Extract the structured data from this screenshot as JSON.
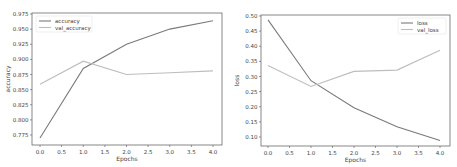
{
  "chart_data": [
    {
      "type": "line",
      "title": "",
      "xlabel": "Epochs",
      "ylabel": "accuracy",
      "x": [
        0,
        1,
        2,
        3,
        4
      ],
      "xticks": [
        "0.0",
        "0.5",
        "1.0",
        "1.5",
        "2.0",
        "2.5",
        "3.0",
        "3.5",
        "4.0"
      ],
      "yticks": [
        "0.775",
        "0.800",
        "0.825",
        "0.850",
        "0.875",
        "0.900",
        "0.925",
        "0.950",
        "0.975"
      ],
      "ylim": [
        0.765,
        0.978
      ],
      "xlim": [
        -0.2,
        4.2
      ],
      "grid": false,
      "legend_position": "upper left",
      "series": [
        {
          "name": "accuracy",
          "color": "#7a7a7a",
          "values": [
            0.77,
            0.885,
            0.925,
            0.95,
            0.964
          ]
        },
        {
          "name": "val_accuracy",
          "color": "#bdbdbd",
          "values": [
            0.859,
            0.897,
            0.875,
            0.878,
            0.881
          ]
        }
      ]
    },
    {
      "type": "line",
      "title": "",
      "xlabel": "Epochs",
      "ylabel": "loss",
      "x": [
        0,
        1,
        2,
        3,
        4
      ],
      "xticks": [
        "0.0",
        "0.5",
        "1.0",
        "1.5",
        "2.0",
        "2.5",
        "3.0",
        "3.5",
        "4.0"
      ],
      "yticks": [
        "0.10",
        "0.15",
        "0.20",
        "0.25",
        "0.30",
        "0.35",
        "0.40",
        "0.45",
        "0.50"
      ],
      "ylim": [
        0.07,
        0.505
      ],
      "xlim": [
        -0.2,
        4.2
      ],
      "grid": false,
      "legend_position": "upper right",
      "series": [
        {
          "name": "loss",
          "color": "#7a7a7a",
          "values": [
            0.487,
            0.286,
            0.197,
            0.134,
            0.088
          ]
        },
        {
          "name": "val_loss",
          "color": "#bdbdbd",
          "values": [
            0.336,
            0.267,
            0.317,
            0.321,
            0.387
          ]
        }
      ]
    }
  ]
}
